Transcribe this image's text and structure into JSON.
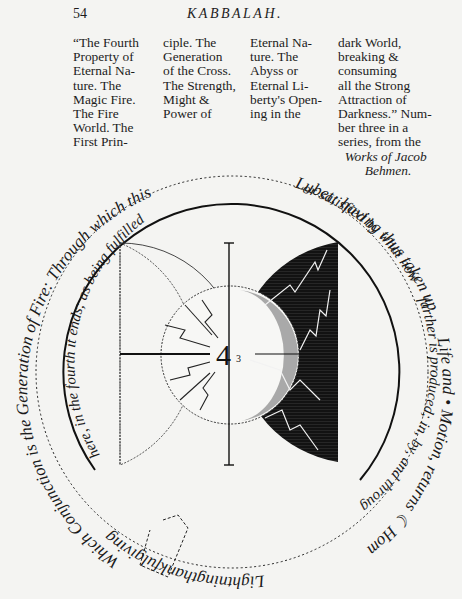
{
  "header": {
    "page_number": "54",
    "running_title": "KABBALAH."
  },
  "caption": {
    "columns": [
      [
        "“The Fourth",
        "Property of",
        "Eternal Na-",
        "ture. The",
        "Magic Fire.",
        "The Fire",
        "World. The",
        "First Prin-"
      ],
      [
        "ciple. The",
        "Generation",
        "of the Cross.",
        "The Strength,",
        "Might &",
        "Power of"
      ],
      [
        "Eternal Na-",
        "ture. The",
        "Abyss or",
        "Eternal Li-",
        "berty's Open-",
        "ing in the"
      ],
      [
        "dark World,",
        "breaking &",
        "consuming",
        "all the Strong",
        "Attraction of",
        "Darkness.” Num-",
        "ber three in a",
        "series, from the"
      ]
    ],
    "source_italic": [
      "Works of Jacob",
      "Behmen."
    ]
  },
  "figure": {
    "center_symbol": "4",
    "center_subscript": "3",
    "outer_ring_text": "Which Conjunction is the Generation of Fire: Through which this Lubet, having thus taken up Life and Motion, returns Home in the Lightning/thanksgiving",
    "inner_ring_text": "here, in the fourth it ends; as being fulfilled or satisfied by what now farther is produced; in, by, and through the Fire.",
    "outer_ring_segments": {
      "left": "Which Conjunction is the Generation of Fire: Through which this",
      "top": "Lubet; having thus taken up",
      "right": "Life and • Motion, returns ☾ Home in the",
      "bottom": "Lightningthankfulgiving"
    },
    "inner_ring_segments": {
      "left": "here, in the fourth it ends; as being fulfilled",
      "top": "or satisfied by what now",
      "right": "farther is produced; in, by, and through the Fire."
    },
    "colors": {
      "ink": "#1a1a1a",
      "paper": "#f4f4f2",
      "dark_half": "#121212"
    }
  }
}
